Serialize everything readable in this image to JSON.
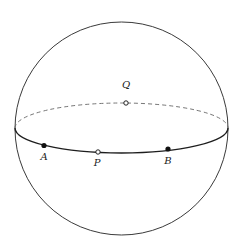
{
  "diagram": {
    "type": "sphere-with-equator",
    "colors": {
      "background": "#ffffff",
      "outline": "#3a3a3a",
      "equator_front": "#1e1e1e",
      "equator_back": "#666666",
      "point_fill": "#111111"
    },
    "sphere": {
      "cx": 121.5,
      "cy": 128.5,
      "r": 106.5
    },
    "equator": {
      "cx": 121.5,
      "cy": 128,
      "rx": 106.5,
      "ry": 25
    },
    "points": [
      {
        "id": "Q",
        "label": "Q",
        "style": "open",
        "x": 126,
        "y": 103,
        "label_x": 126,
        "label_y": 88
      },
      {
        "id": "A",
        "label": "A",
        "style": "filled",
        "x": 44,
        "y": 145.5,
        "label_x": 44,
        "label_y": 160
      },
      {
        "id": "P",
        "label": "P",
        "style": "open",
        "x": 98,
        "y": 152,
        "label_x": 97,
        "label_y": 166
      },
      {
        "id": "B",
        "label": "B",
        "style": "filled",
        "x": 168,
        "y": 149,
        "label_x": 168,
        "label_y": 164
      }
    ]
  }
}
